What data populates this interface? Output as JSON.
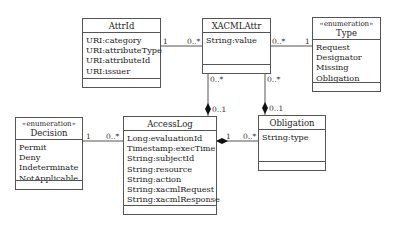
{
  "classes": {
    "attrid": {
      "name": "AttrId",
      "attributes": [
        "URI:category",
        "URI:attributeType",
        "URI:attributeId",
        "URI:issuer"
      ]
    },
    "xacmlattr": {
      "name": "XACMLAttr",
      "attributes": [
        "String:value"
      ]
    },
    "type": {
      "stereotype": "«enumeration»",
      "name": "Type",
      "attributes": [
        "Request",
        "Designator",
        "Missing",
        "Obligation"
      ]
    },
    "decision": {
      "stereotype": "«enumeration»",
      "name": "Decision",
      "attributes": [
        "Permit",
        "Deny",
        "Indeterminate",
        "NotApplicable"
      ]
    },
    "accesslog": {
      "name": "AccessLog",
      "attributes": [
        "Long:evaluationId",
        "Timestamp:execTime",
        "String:subjectId",
        "String:resource",
        "String:action",
        "String:xacmlRequest",
        "String:xacmlResponse"
      ]
    },
    "obligation": {
      "name": "Obligation",
      "attributes": [
        "String:type"
      ]
    }
  },
  "associations": {
    "attrid_xacmlattr": {
      "source_mult": "1",
      "target_mult": "0..*"
    },
    "xacmlattr_type": {
      "source_mult": "0..*",
      "target_mult": "1"
    },
    "xacmlattr_accesslog": {
      "source_mult": "0..*",
      "target_mult": "0..1"
    },
    "xacmlattr_obligation": {
      "source_mult": "0..*",
      "target_mult": "0..1"
    },
    "decision_accesslog": {
      "source_mult": "1",
      "target_mult": "0..*"
    },
    "accesslog_obligation": {
      "source_mult": "1",
      "target_mult": "0..*"
    }
  }
}
